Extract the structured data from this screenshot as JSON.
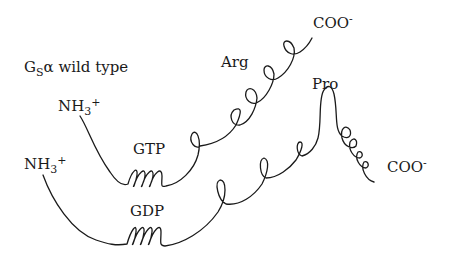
{
  "figure": {
    "title": {
      "prefix": "G",
      "subscript": "S",
      "greek": "α",
      "suffix": " wild type"
    },
    "wild_type_chain": {
      "n_terminus": {
        "base": "NH",
        "sub": "3",
        "sup": "+"
      },
      "nucleotide_label": "GTP",
      "residue_label": "Arg",
      "c_terminus": {
        "base": "COO",
        "sup": "-"
      }
    },
    "mutant_chain": {
      "n_terminus": {
        "base": "NH",
        "sub": "3",
        "sup": "+"
      },
      "nucleotide_label": "GDP",
      "residue_label": "Pro",
      "c_terminus": {
        "base": "COO",
        "sup": "-"
      }
    }
  },
  "colors": {
    "line": "#1a1a1a",
    "background": "#ffffff"
  }
}
